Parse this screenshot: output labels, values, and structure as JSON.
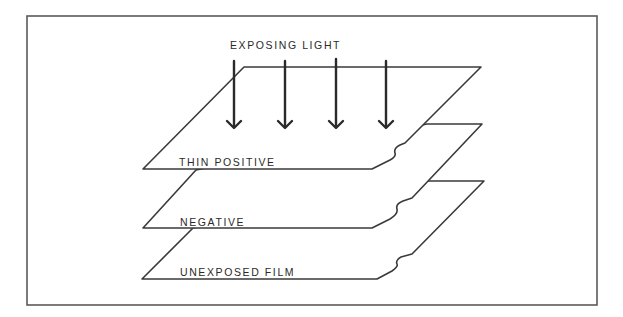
{
  "diagram": {
    "title_label": "EXPOSING LIGHT",
    "arrows": {
      "count": 4,
      "direction": "down",
      "icon": "arrow-down-icon"
    },
    "layers": [
      {
        "label": "THIN POSITIVE",
        "position": "top"
      },
      {
        "label": "NEGATIVE",
        "position": "middle"
      },
      {
        "label": "UNEXPOSED FILM",
        "position": "bottom"
      }
    ]
  },
  "colors": {
    "line": "#3a3a3a",
    "frame": "#5a5a5a",
    "background": "#ffffff"
  }
}
